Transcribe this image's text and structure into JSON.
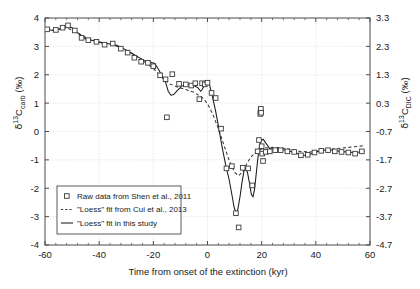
{
  "chart_data": {
    "type": "line",
    "title": "",
    "xlabel": "Time from onset of the extinction (kyr)",
    "ylabel_left": "δ13Ccarb (‰)",
    "ylabel_right": "δ13CDIC (‰)",
    "xlim": [
      -60,
      60
    ],
    "xticks": [
      -60,
      -40,
      -20,
      0,
      20,
      40,
      60
    ],
    "xtick_labels": [
      "-60",
      "-40",
      "-20",
      "0",
      "20",
      "40",
      "60"
    ],
    "ylim_left": [
      -4,
      4
    ],
    "yticks_left": [
      -4,
      -3,
      -2,
      -1,
      0,
      1,
      2,
      3,
      4
    ],
    "ytick_labels_left": [
      "-4",
      "-3",
      "-2",
      "-1",
      "0",
      "1",
      "2",
      "3",
      "4"
    ],
    "ylim_right": [
      -4.7,
      3.3
    ],
    "yticks_right": [
      -4.7,
      -3.7,
      -2.7,
      -1.7,
      -0.7,
      0.3,
      1.3,
      2.3,
      3.3
    ],
    "ytick_labels_right": [
      "-4.7",
      "-3.7",
      "-2.7",
      "-1.7",
      "-0.7",
      "0.3",
      "1.3",
      "2.3",
      "3.3"
    ],
    "grid": true,
    "legend_position": "lower-left",
    "series": [
      {
        "name": "Raw data from Shen et al., 2011",
        "type": "scatter",
        "marker": "open-square",
        "color": "#3a3a3a",
        "points": [
          [
            -59.2,
            3.6
          ],
          [
            -56.0,
            3.58
          ],
          [
            -53.5,
            3.66
          ],
          [
            -51.5,
            3.74
          ],
          [
            -49.0,
            3.56
          ],
          [
            -46.5,
            3.3
          ],
          [
            -44.0,
            3.22
          ],
          [
            -41.0,
            3.16
          ],
          [
            -38.0,
            3.06
          ],
          [
            -35.0,
            3.1
          ],
          [
            -32.0,
            2.92
          ],
          [
            -29.5,
            2.78
          ],
          [
            -27.0,
            2.6
          ],
          [
            -24.5,
            2.46
          ],
          [
            -22.0,
            2.42
          ],
          [
            -20.0,
            2.3
          ],
          [
            -17.5,
            1.98
          ],
          [
            -15.5,
            1.84
          ],
          [
            -15.0,
            0.5
          ],
          [
            -13.0,
            2.02
          ],
          [
            -10.5,
            1.68
          ],
          [
            -8.0,
            1.66
          ],
          [
            -6.0,
            1.62
          ],
          [
            -4.5,
            1.7
          ],
          [
            -3.0,
            1.14
          ],
          [
            -2.0,
            1.7
          ],
          [
            -1.0,
            1.66
          ],
          [
            0.0,
            1.72
          ],
          [
            1.5,
            1.36
          ],
          [
            3.0,
            1.18
          ],
          [
            5.0,
            0.1
          ],
          [
            7.0,
            -1.3
          ],
          [
            9.0,
            -1.22
          ],
          [
            10.5,
            -2.88
          ],
          [
            11.5,
            -3.38
          ],
          [
            13.0,
            -1.28
          ],
          [
            15.0,
            -1.3
          ],
          [
            16.5,
            -1.9
          ],
          [
            18.5,
            -0.7
          ],
          [
            19.0,
            -0.3
          ],
          [
            19.5,
            0.62
          ],
          [
            19.6,
            0.72
          ],
          [
            19.7,
            0.8
          ],
          [
            19.8,
            0.66
          ],
          [
            20.0,
            -0.52
          ],
          [
            20.2,
            -0.78
          ],
          [
            20.5,
            -1.04
          ],
          [
            21.5,
            -0.72
          ],
          [
            23.0,
            -0.7
          ],
          [
            25.0,
            -0.66
          ],
          [
            27.0,
            -0.66
          ],
          [
            29.5,
            -0.7
          ],
          [
            32.0,
            -0.72
          ],
          [
            34.5,
            -0.84
          ],
          [
            37.0,
            -0.82
          ],
          [
            39.5,
            -0.74
          ],
          [
            42.0,
            -0.68
          ],
          [
            44.5,
            -0.66
          ],
          [
            47.0,
            -0.7
          ],
          [
            49.5,
            -0.72
          ],
          [
            52.0,
            -0.74
          ],
          [
            54.5,
            -0.78
          ],
          [
            57.0,
            -0.7
          ]
        ]
      },
      {
        "name": "\"Loess\" fit from Cui et al., 2013",
        "type": "line",
        "style": "dashed",
        "color": "#3a3a3a",
        "points": [
          [
            -59.5,
            3.56
          ],
          [
            -56.0,
            3.58
          ],
          [
            -52.0,
            3.66
          ],
          [
            -48.0,
            3.48
          ],
          [
            -44.0,
            3.26
          ],
          [
            -40.0,
            3.16
          ],
          [
            -36.0,
            3.08
          ],
          [
            -32.0,
            2.96
          ],
          [
            -28.0,
            2.76
          ],
          [
            -24.0,
            2.5
          ],
          [
            -20.0,
            2.22
          ],
          [
            -17.0,
            1.92
          ],
          [
            -14.0,
            1.68
          ],
          [
            -11.0,
            1.56
          ],
          [
            -8.0,
            1.48
          ],
          [
            -5.0,
            1.38
          ],
          [
            -2.0,
            1.2
          ],
          [
            0.0,
            0.98
          ],
          [
            2.0,
            0.6
          ],
          [
            4.0,
            0.1
          ],
          [
            6.0,
            -0.46
          ],
          [
            8.0,
            -1.02
          ],
          [
            10.0,
            -1.44
          ],
          [
            11.5,
            -1.56
          ],
          [
            13.0,
            -1.42
          ],
          [
            14.5,
            -1.14
          ],
          [
            16.0,
            -0.9
          ],
          [
            17.5,
            -0.76
          ],
          [
            19.0,
            -0.66
          ],
          [
            21.0,
            -0.58
          ],
          [
            24.0,
            -0.56
          ],
          [
            27.0,
            -0.58
          ],
          [
            30.0,
            -0.62
          ],
          [
            34.0,
            -0.7
          ],
          [
            38.0,
            -0.72
          ],
          [
            42.0,
            -0.68
          ],
          [
            46.0,
            -0.62
          ],
          [
            50.0,
            -0.58
          ],
          [
            54.0,
            -0.54
          ],
          [
            58.0,
            -0.5
          ]
        ]
      },
      {
        "name": "\"Loess\" fit in this study",
        "type": "line",
        "style": "solid",
        "color": "#1a1a1a",
        "points": [
          [
            -59.5,
            3.6
          ],
          [
            -57.0,
            3.56
          ],
          [
            -54.5,
            3.62
          ],
          [
            -52.0,
            3.72
          ],
          [
            -50.0,
            3.66
          ],
          [
            -47.5,
            3.44
          ],
          [
            -45.0,
            3.26
          ],
          [
            -42.0,
            3.2
          ],
          [
            -39.0,
            3.12
          ],
          [
            -36.0,
            3.08
          ],
          [
            -33.5,
            3.04
          ],
          [
            -31.0,
            2.92
          ],
          [
            -28.0,
            2.76
          ],
          [
            -25.5,
            2.62
          ],
          [
            -23.0,
            2.48
          ],
          [
            -21.0,
            2.44
          ],
          [
            -19.5,
            2.4
          ],
          [
            -18.0,
            2.18
          ],
          [
            -16.5,
            1.9
          ],
          [
            -15.5,
            1.74
          ],
          [
            -14.5,
            1.42
          ],
          [
            -13.5,
            1.28
          ],
          [
            -12.5,
            1.3
          ],
          [
            -11.0,
            1.46
          ],
          [
            -9.5,
            1.6
          ],
          [
            -8.0,
            1.66
          ],
          [
            -6.5,
            1.66
          ],
          [
            -5.0,
            1.62
          ],
          [
            -3.5,
            1.54
          ],
          [
            -2.5,
            1.42
          ],
          [
            -2.0,
            1.48
          ],
          [
            -1.0,
            1.64
          ],
          [
            0.0,
            1.72
          ],
          [
            0.8,
            1.62
          ],
          [
            1.8,
            1.24
          ],
          [
            3.0,
            0.72
          ],
          [
            4.2,
            0.1
          ],
          [
            5.5,
            -0.6
          ],
          [
            6.8,
            -1.22
          ],
          [
            8.0,
            -1.7
          ],
          [
            9.0,
            -2.22
          ],
          [
            9.8,
            -2.66
          ],
          [
            10.5,
            -2.88
          ],
          [
            11.2,
            -2.74
          ],
          [
            12.0,
            -2.3
          ],
          [
            12.8,
            -1.76
          ],
          [
            13.5,
            -1.38
          ],
          [
            14.2,
            -1.3
          ],
          [
            14.8,
            -1.46
          ],
          [
            15.5,
            -1.82
          ],
          [
            16.2,
            -2.22
          ],
          [
            16.8,
            -2.3
          ],
          [
            17.4,
            -2.02
          ],
          [
            18.0,
            -1.48
          ],
          [
            18.6,
            -0.94
          ],
          [
            19.2,
            -0.52
          ],
          [
            19.8,
            -0.3
          ],
          [
            20.6,
            -0.28
          ],
          [
            21.6,
            -0.42
          ],
          [
            23.0,
            -0.6
          ],
          [
            25.0,
            -0.64
          ],
          [
            27.5,
            -0.64
          ],
          [
            30.0,
            -0.68
          ],
          [
            32.5,
            -0.76
          ],
          [
            35.0,
            -0.84
          ],
          [
            37.0,
            -0.84
          ],
          [
            39.0,
            -0.76
          ],
          [
            41.5,
            -0.68
          ],
          [
            44.0,
            -0.64
          ],
          [
            46.5,
            -0.66
          ],
          [
            49.0,
            -0.7
          ],
          [
            51.5,
            -0.72
          ],
          [
            54.0,
            -0.74
          ],
          [
            56.5,
            -0.72
          ],
          [
            58.0,
            -0.7
          ]
        ]
      }
    ],
    "legend": [
      {
        "label": "Raw data from Shen et al., 2011",
        "marker": "open-square"
      },
      {
        "label": "\"Loess\" fit from Cui et al., 2013",
        "marker": "dashed-line"
      },
      {
        "label": "\"Loess\" fit in this study",
        "marker": "solid-line"
      }
    ]
  }
}
